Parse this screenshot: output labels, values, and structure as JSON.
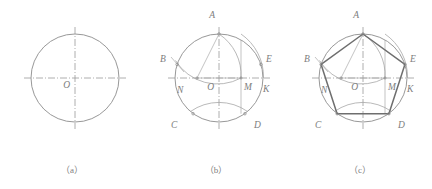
{
  "figure": {
    "background_color": "#ffffff",
    "line_color": "#8c8c8c",
    "polygon_color": "#6e6e6e",
    "label_color": "#7d7d7d"
  },
  "panels": [
    {
      "id": "a",
      "caption": "（a）",
      "description": "Given circle with horizontal and vertical center lines",
      "labels": [
        {
          "text": "O",
          "x": 70,
          "y": 88
        }
      ]
    },
    {
      "id": "b",
      "caption": "（b）",
      "description": "Locate midpoint N of left radius, swing arcs to find chord points",
      "labels": [
        {
          "text": "A",
          "x": 71,
          "y": 18
        },
        {
          "text": "B",
          "x": 16,
          "y": 62
        },
        {
          "text": "E",
          "x": 122,
          "y": 62
        },
        {
          "text": "N",
          "x": 33,
          "y": 93
        },
        {
          "text": "O",
          "x": 70,
          "y": 90
        },
        {
          "text": "M",
          "x": 104,
          "y": 90
        },
        {
          "text": "K",
          "x": 122,
          "y": 92
        },
        {
          "text": "C",
          "x": 27,
          "y": 128
        },
        {
          "text": "D",
          "x": 113,
          "y": 128
        }
      ]
    },
    {
      "id": "c",
      "caption": "（c）",
      "description": "Connect the five points to complete regular pentagon ABCDE",
      "labels": [
        {
          "text": "A",
          "x": 71,
          "y": 18
        },
        {
          "text": "B",
          "x": 16,
          "y": 62
        },
        {
          "text": "E",
          "x": 122,
          "y": 62
        },
        {
          "text": "N",
          "x": 33,
          "y": 93
        },
        {
          "text": "O",
          "x": 70,
          "y": 90
        },
        {
          "text": "M",
          "x": 104,
          "y": 90
        },
        {
          "text": "K",
          "x": 122,
          "y": 92
        },
        {
          "text": "C",
          "x": 27,
          "y": 128
        },
        {
          "text": "D",
          "x": 113,
          "y": 128
        }
      ]
    }
  ],
  "geometry": {
    "center": {
      "x": 75,
      "y": 78
    },
    "radius": 44,
    "pentagon_vertices": [
      {
        "name": "A",
        "x": 75.0,
        "y": 34.0
      },
      {
        "name": "B",
        "x": 33.1,
        "y": 64.4
      },
      {
        "name": "C",
        "x": 49.1,
        "y": 113.7
      },
      {
        "name": "D",
        "x": 100.9,
        "y": 113.7
      },
      {
        "name": "E",
        "x": 116.9,
        "y": 64.4
      }
    ],
    "construction_points": [
      {
        "name": "N",
        "x": 53.0,
        "y": 78.0
      },
      {
        "name": "O",
        "x": 75.0,
        "y": 78.0
      },
      {
        "name": "M",
        "x": 97.0,
        "y": 78.0
      },
      {
        "name": "K",
        "x": 119.0,
        "y": 78.0
      }
    ]
  }
}
